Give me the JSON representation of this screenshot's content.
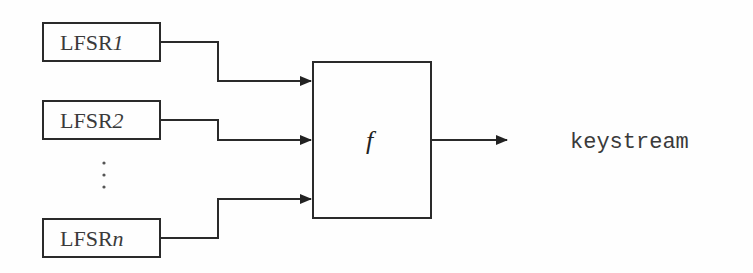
{
  "diagram": {
    "inputs": [
      {
        "label": "LFSR",
        "index": "1"
      },
      {
        "label": "LFSR",
        "index": "2"
      },
      {
        "label": "LFSR",
        "index": "n"
      }
    ],
    "ellipsis": "⋮",
    "function_label": "f",
    "output_label": "keystream",
    "stroke_color": "#2a2a2a"
  }
}
